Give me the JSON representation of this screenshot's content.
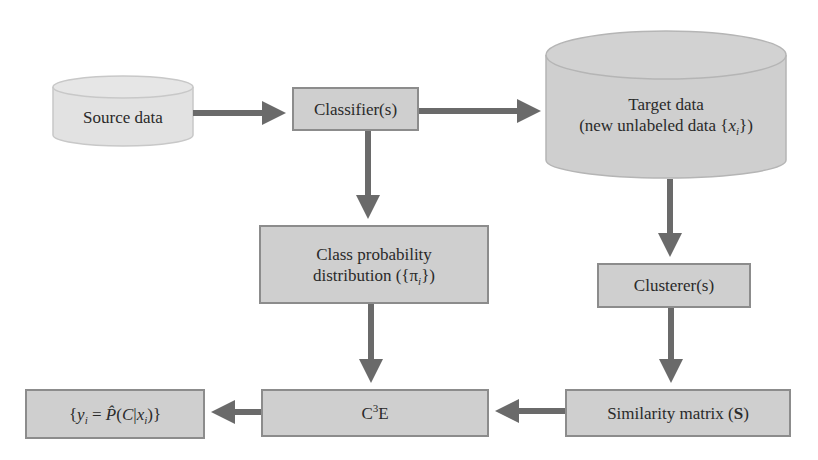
{
  "diagram": {
    "colors": {
      "box_fill": "#cfcfcf",
      "box_border": "#8c8c8c",
      "source_fill": "#e2e2e2",
      "arrow": "#6a6a6a",
      "text": "#2a2a2a"
    },
    "nodes": {
      "source": {
        "label": "Source data",
        "shape": "cylinder"
      },
      "classifier": {
        "label": "Classifier(s)",
        "shape": "rectangle"
      },
      "target": {
        "line1": "Target data",
        "line2_prefix": "(new unlabeled data {",
        "line2_var": "x",
        "line2_sub": "i",
        "line2_suffix": "})",
        "shape": "cylinder"
      },
      "class_prob": {
        "line1": "Class probability",
        "line2_prefix": "distribution ({π",
        "line2_sub": "i",
        "line2_suffix": "})",
        "shape": "rectangle"
      },
      "clusterer": {
        "label": "Clusterer(s)",
        "shape": "rectangle"
      },
      "similarity": {
        "prefix": "Similarity matrix (",
        "bold": "S",
        "suffix": ")",
        "shape": "rectangle"
      },
      "c3e": {
        "base": "C",
        "sup": "3",
        "suffix": "E",
        "shape": "rectangle"
      },
      "output": {
        "open": "{",
        "y": "y",
        "y_sub": "i",
        "eq": " = ",
        "p": "P̂",
        "paren_open": "(",
        "c": "C",
        "bar": "|",
        "x": "x",
        "x_sub": "i",
        "close": ")}",
        "shape": "rectangle"
      }
    },
    "edges": [
      {
        "from": "Source data",
        "to": "Classifier(s)"
      },
      {
        "from": "Classifier(s)",
        "to": "Target data"
      },
      {
        "from": "Classifier(s)",
        "to": "Class probability distribution"
      },
      {
        "from": "Target data",
        "to": "Clusterer(s)"
      },
      {
        "from": "Clusterer(s)",
        "to": "Similarity matrix (S)"
      },
      {
        "from": "Class probability distribution",
        "to": "C3E"
      },
      {
        "from": "Similarity matrix (S)",
        "to": "C3E"
      },
      {
        "from": "C3E",
        "to": "{y_i = P̂(C|x_i)}"
      }
    ]
  }
}
